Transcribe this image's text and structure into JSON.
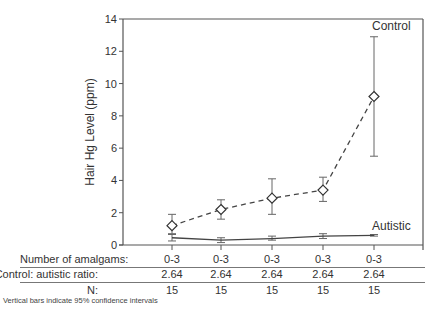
{
  "chart_data": {
    "type": "line",
    "title": "",
    "xlabel": "",
    "ylabel": "Hair Hg Level (ppm)",
    "ylim": [
      0,
      14
    ],
    "yticks": [
      0,
      2,
      4,
      6,
      8,
      10,
      12,
      14
    ],
    "grid": false,
    "x": [
      1,
      2,
      3,
      4,
      5
    ],
    "series": [
      {
        "name": "Control",
        "style": "dashed",
        "marker": "diamond-open",
        "values": [
          1.2,
          2.2,
          2.9,
          3.4,
          9.2
        ],
        "ci_upper": [
          1.9,
          2.8,
          4.1,
          4.2,
          12.9
        ],
        "ci_lower": [
          0.7,
          1.6,
          1.9,
          2.7,
          5.5
        ]
      },
      {
        "name": "Autistic",
        "style": "solid",
        "marker": "none",
        "values": [
          0.45,
          0.3,
          0.4,
          0.55,
          0.6
        ],
        "ci_upper": [
          0.65,
          0.45,
          0.55,
          0.7,
          0.65
        ],
        "ci_lower": [
          0.25,
          0.15,
          0.3,
          0.4,
          0.55
        ]
      }
    ],
    "annotations": [
      "Control",
      "Autistic"
    ],
    "table": {
      "rows": [
        {
          "label": "Number of amalgams:",
          "values": [
            "0-3",
            "0-3",
            "0-3",
            "0-3",
            "0-3"
          ]
        },
        {
          "label": "Control: autistic ratio:",
          "values": [
            "2.64",
            "2.64",
            "2.64",
            "2.64",
            "2.64"
          ]
        },
        {
          "label": "N:",
          "values": [
            "15",
            "15",
            "15",
            "15",
            "15"
          ]
        }
      ]
    },
    "footnote": "Vertical bars indicate 95% confidence intervals"
  },
  "labels": {
    "control": "Control",
    "autistic": "Autistic",
    "ylabel": "Hair Hg Level (ppm)",
    "footnote": "Vertical bars indicate 95% confidence intervals"
  }
}
